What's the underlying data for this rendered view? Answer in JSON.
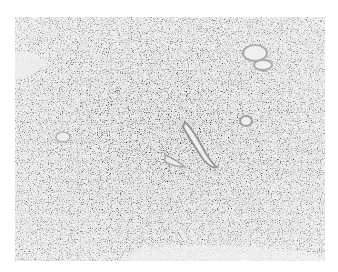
{
  "image": {
    "alt": "Grayscale histology micrograph showing densely packed spindle/stromal cells with scattered blood vessels",
    "palette": {
      "background": "#ffffff",
      "tissue_light": "#e6e6e6",
      "tissue_mid": "#b0b0b0",
      "nuclei": "#3a3a3a",
      "vessel_wall": "#9a9a9a",
      "vessel_lumen": "#efefef"
    }
  }
}
